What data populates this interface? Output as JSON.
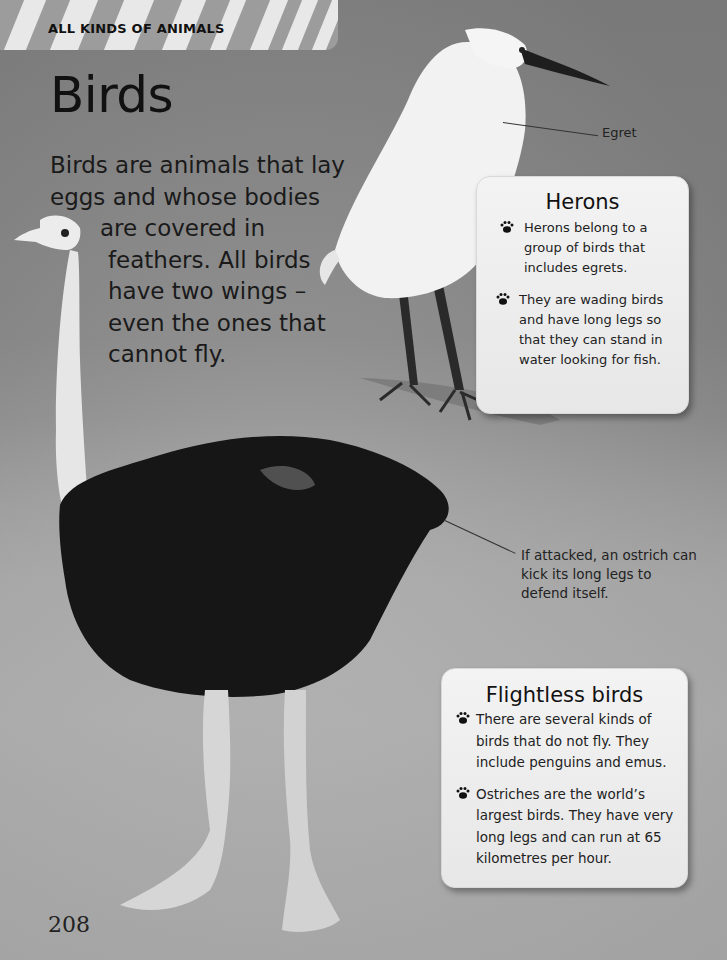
{
  "header": {
    "section_label": "ALL KINDS OF ANIMALS"
  },
  "page": {
    "title": "Birds",
    "intro_lines": [
      "Birds are animals that lay",
      "eggs and whose bodies",
      "are covered in",
      "feathers. All birds",
      "have two wings –",
      "even the ones that",
      "cannot fly."
    ],
    "page_number": "208"
  },
  "callouts": {
    "egret": "Egret",
    "ostrich": "If attacked, an ostrich can kick its long legs to defend itself."
  },
  "boxes": {
    "herons": {
      "title": "Herons",
      "bullets": [
        "Herons belong to a group of birds that includes egrets.",
        "They are wading birds and have long legs so that they can stand in water looking for fish."
      ]
    },
    "flightless": {
      "title": "Flightless birds",
      "bullets": [
        "There are several kinds of birds that do not fly. They include penguins and emus.",
        "Ostriches are the world’s largest birds. They have very long legs and can run at 65 kilometres per hour."
      ]
    }
  },
  "icons": {
    "bullet": "paw-print-icon"
  },
  "colors": {
    "background": "#8f8f8f",
    "box_background": "#efefef",
    "text": "#1a1a1a",
    "banner_stripe": "#e8e8e8"
  }
}
